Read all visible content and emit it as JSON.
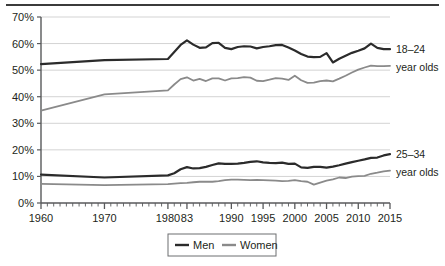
{
  "chart_data": {
    "type": "line",
    "title": "",
    "subtitle": "",
    "xlabel": "",
    "ylabel": "",
    "xlim": [
      1960,
      2015
    ],
    "ylim": [
      0,
      70
    ],
    "y_tick_labels": [
      "0%",
      "10%",
      "20%",
      "30%",
      "40%",
      "50%",
      "60%",
      "70%"
    ],
    "y_tick_values": [
      0,
      10,
      20,
      30,
      40,
      50,
      60,
      70
    ],
    "x_tick_labels": [
      "1960",
      "1970",
      "1980",
      "83",
      "1990",
      "1995",
      "2000",
      "2005",
      "2010",
      "2015"
    ],
    "x_tick_values": [
      1960,
      1970,
      1980,
      1983,
      1990,
      1995,
      2000,
      2005,
      2010,
      2015
    ],
    "grid": "horizontal",
    "legend_position": "bottom",
    "legend": [
      "Men",
      "Women"
    ],
    "annotations": [
      {
        "id": "group-18-24",
        "line1": "18–24",
        "line2": "year olds"
      },
      {
        "id": "group-25-34",
        "line1": "25–34",
        "line2": "year olds"
      }
    ],
    "colors": {
      "men": "#2b2b2b",
      "women": "#8a8a8a",
      "grid": "#d3d3d3",
      "axis": "#58595b"
    },
    "series": [
      {
        "name": "Men 18-24",
        "group": "18–24 year olds",
        "sex": "Men",
        "color": "#2b2b2b",
        "x": [
          1960,
          1970,
          1980,
          1981,
          1982,
          1983,
          1984,
          1985,
          1986,
          1987,
          1988,
          1989,
          1990,
          1991,
          1992,
          1993,
          1994,
          1995,
          1996,
          1997,
          1998,
          1999,
          2000,
          2001,
          2002,
          2003,
          2004,
          2005,
          2006,
          2007,
          2008,
          2009,
          2010,
          2011,
          2012,
          2013,
          2014,
          2015
        ],
        "values": [
          52.3,
          53.8,
          54.2,
          56.8,
          59.5,
          61.2,
          59.6,
          58.4,
          58.6,
          60.2,
          60.3,
          58.4,
          57.9,
          58.7,
          59.0,
          58.9,
          58.2,
          58.7,
          59.0,
          59.4,
          59.5,
          58.5,
          57.4,
          56.1,
          55.1,
          54.9,
          55.0,
          56.4,
          52.9,
          54.3,
          55.4,
          56.5,
          57.3,
          58.2,
          60.0,
          58.4,
          57.9,
          57.9
        ]
      },
      {
        "name": "Women 18-24",
        "group": "18–24 year olds",
        "sex": "Women",
        "color": "#8a8a8a",
        "x": [
          1960,
          1970,
          1980,
          1981,
          1982,
          1983,
          1984,
          1985,
          1986,
          1987,
          1988,
          1989,
          1990,
          1991,
          1992,
          1993,
          1994,
          1995,
          1996,
          1997,
          1998,
          1999,
          2000,
          2001,
          2002,
          2003,
          2004,
          2005,
          2006,
          2007,
          2008,
          2009,
          2010,
          2011,
          2012,
          2013,
          2014,
          2015
        ],
        "values": [
          34.8,
          40.9,
          42.4,
          44.6,
          46.6,
          47.3,
          46.1,
          46.7,
          45.9,
          46.9,
          46.9,
          46.1,
          46.9,
          47.0,
          47.4,
          47.2,
          46.0,
          45.9,
          46.4,
          47.0,
          46.8,
          46.3,
          47.9,
          46.2,
          45.2,
          45.3,
          45.9,
          46.1,
          45.8,
          46.8,
          47.9,
          49.1,
          50.2,
          51.0,
          51.7,
          51.5,
          51.5,
          51.6
        ]
      },
      {
        "name": "Men 25-34",
        "group": "25–34 year olds",
        "sex": "Men",
        "color": "#2b2b2b",
        "x": [
          1960,
          1970,
          1980,
          1981,
          1982,
          1983,
          1984,
          1985,
          1986,
          1987,
          1988,
          1989,
          1990,
          1991,
          1992,
          1993,
          1994,
          1995,
          1996,
          1997,
          1998,
          1999,
          2000,
          2001,
          2002,
          2003,
          2004,
          2005,
          2006,
          2007,
          2008,
          2009,
          2010,
          2011,
          2012,
          2013,
          2014,
          2015
        ],
        "values": [
          10.7,
          9.6,
          10.4,
          11.2,
          12.7,
          13.5,
          13.0,
          13.1,
          13.6,
          14.3,
          14.9,
          14.7,
          14.7,
          14.8,
          15.1,
          15.5,
          15.7,
          15.3,
          15.1,
          15.0,
          15.2,
          14.7,
          14.8,
          13.4,
          13.2,
          13.6,
          13.6,
          13.3,
          13.7,
          14.2,
          14.8,
          15.4,
          15.9,
          16.4,
          17.0,
          17.1,
          17.9,
          18.4
        ]
      },
      {
        "name": "Women 25-34",
        "group": "25–34 year olds",
        "sex": "Women",
        "color": "#8a8a8a",
        "x": [
          1960,
          1970,
          1980,
          1981,
          1982,
          1983,
          1984,
          1985,
          1986,
          1987,
          1988,
          1989,
          1990,
          1991,
          1992,
          1993,
          1994,
          1995,
          1996,
          1997,
          1998,
          1999,
          2000,
          2001,
          2002,
          2003,
          2004,
          2005,
          2006,
          2007,
          2008,
          2009,
          2010,
          2011,
          2012,
          2013,
          2014,
          2015
        ],
        "values": [
          7.2,
          6.7,
          7.1,
          7.3,
          7.5,
          7.6,
          7.8,
          8.0,
          8.0,
          8.0,
          8.2,
          8.6,
          8.8,
          8.8,
          8.7,
          8.6,
          8.7,
          8.6,
          8.5,
          8.4,
          8.2,
          8.3,
          8.6,
          8.2,
          8.0,
          6.9,
          7.7,
          8.4,
          8.9,
          9.6,
          9.4,
          9.9,
          10.1,
          10.2,
          11.0,
          11.4,
          11.9,
          12.2
        ]
      }
    ]
  }
}
